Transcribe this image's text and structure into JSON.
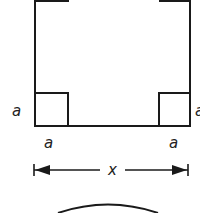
{
  "diagram": {
    "labels": {
      "left_side": "a",
      "right_side": "a",
      "bottom_left": "a",
      "bottom_right": "a",
      "dimension": "x"
    },
    "colors": {
      "stroke": "#1a1a1a",
      "background": "#ffffff"
    }
  }
}
